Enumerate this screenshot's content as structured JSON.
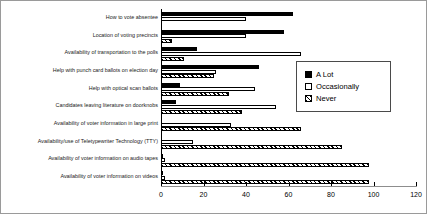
{
  "chart_data": {
    "type": "bar",
    "orientation": "horizontal",
    "title": "",
    "xlabel": "",
    "ylabel": "",
    "xlim": [
      0,
      120
    ],
    "xticks": [
      0,
      20,
      40,
      60,
      80,
      100,
      120
    ],
    "grid": false,
    "legend_position": "center-right",
    "categories": [
      "How to vote absentee",
      "Location of voting precincts",
      "Availability of transportation to the polls",
      "Help with punch card ballots on election day",
      "Help with optical scan ballots",
      "Candidates leaving literature on doorknobs",
      "Availability of voter information in large print",
      "Availability/use of Teletypewriter Technology (TTY)",
      "Availability of voter information on audio tapes",
      "Availability of voter information on videos"
    ],
    "series": [
      {
        "name": "A Lot",
        "color": "#000000",
        "fill": "solid",
        "values": [
          62,
          58,
          17,
          46,
          9,
          7,
          0,
          0,
          1,
          1
        ]
      },
      {
        "name": "Occasionally",
        "color": "#ffffff",
        "fill": "hollow",
        "values": [
          40,
          40,
          66,
          26,
          44,
          54,
          33,
          15,
          2,
          2
        ]
      },
      {
        "name": "Never",
        "color": "#000000",
        "fill": "hatched",
        "values": [
          0,
          5,
          11,
          25,
          32,
          38,
          66,
          85,
          98,
          98
        ]
      }
    ]
  },
  "legend": {
    "items": [
      {
        "label": "A Lot"
      },
      {
        "label": "Occasionally"
      },
      {
        "label": "Never"
      }
    ]
  }
}
